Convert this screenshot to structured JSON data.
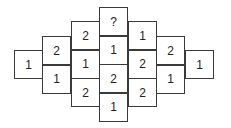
{
  "puzzle": {
    "cell_size": 29,
    "columns": [
      {
        "x": 14,
        "top": 50,
        "values": [
          "1"
        ]
      },
      {
        "x": 42,
        "top": 36,
        "values": [
          "2",
          "1"
        ]
      },
      {
        "x": 71,
        "top": 21,
        "values": [
          "2",
          "1",
          "2"
        ]
      },
      {
        "x": 99,
        "top": 7,
        "values": [
          "?",
          "1",
          "2",
          "1"
        ]
      },
      {
        "x": 128,
        "top": 21,
        "values": [
          "1",
          "2",
          "2"
        ]
      },
      {
        "x": 156,
        "top": 36,
        "values": [
          "2",
          "1"
        ]
      },
      {
        "x": 185,
        "top": 50,
        "values": [
          "1"
        ]
      }
    ]
  }
}
